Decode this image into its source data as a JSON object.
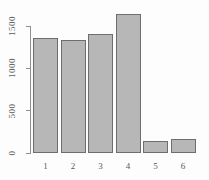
{
  "chart_data": {
    "type": "bar",
    "categories": [
      "1",
      "2",
      "3",
      "4",
      "5",
      "6"
    ],
    "values": [
      1355,
      1325,
      1405,
      1630,
      140,
      155
    ],
    "title": "",
    "xlabel": "",
    "ylabel": "",
    "yticks": [
      0,
      500,
      1000,
      1500
    ],
    "ytick_labels": [
      "0",
      "500",
      "1000",
      "1500"
    ],
    "ylim": [
      0,
      1660
    ],
    "grid": false,
    "legend": "none",
    "colors": {
      "bar_fill": "#b7b7b7",
      "bar_border": "#6e6e6e",
      "axis": "#8f8f8f",
      "text": "#585858",
      "background": "#fdfdfd"
    }
  }
}
